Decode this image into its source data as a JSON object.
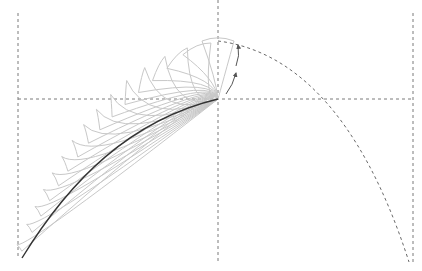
{
  "diagram": {
    "title": "",
    "colors": {
      "background": "#ffffff",
      "guide_line": "#7a7a7a",
      "solid_curve": "#333333",
      "petal": "#c8c8c8",
      "arrow": "#555555",
      "trajectory": "#6a6a6a"
    },
    "guides": {
      "left_vertical": {
        "x": 18,
        "y1": 13,
        "y2": 258
      },
      "middle_vertical": {
        "x": 218,
        "y1": 0,
        "y2": 262
      },
      "right_vertical": {
        "x": 413,
        "y1": 13,
        "y2": 262
      },
      "horizontal": {
        "y": 99,
        "x1": 18,
        "x2": 413
      }
    },
    "solid_curve": {
      "start": [
        22,
        258
      ],
      "end": [
        218,
        99
      ]
    },
    "pivot_point": [
      218,
      99
    ],
    "apex_point": [
      218,
      41
    ],
    "trajectory": {
      "start": [
        218,
        41
      ],
      "end": [
        409,
        262
      ],
      "crosses_horizontal_at_x": 341
    },
    "petal_count": 16,
    "arrows": [
      {
        "label": "rotation-arrow-lower",
        "from": [
          227,
          94
        ],
        "to": [
          236,
          72
        ]
      },
      {
        "label": "rotation-arrow-upper",
        "from": [
          238,
          66
        ],
        "to": [
          238,
          44
        ]
      }
    ]
  }
}
